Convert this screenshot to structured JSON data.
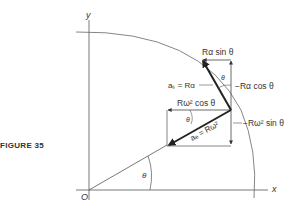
{
  "figure": {
    "caption": "FIGURE 35",
    "axes": {
      "x_label": "x",
      "y_label": "y",
      "origin_label": "O"
    },
    "angle_label": "θ",
    "tangential": {
      "vector_label": "aₛ = Rα",
      "horizontal_component": "Rα sin θ",
      "vertical_component": "−Rα cos θ",
      "angle_label": "θ"
    },
    "centripetal": {
      "vector_label": "aₑ = Rω²",
      "horizontal_component": "Rω² cos θ",
      "vertical_component": "−Rω² sin θ",
      "angle_label": "θ"
    },
    "colors": {
      "ink": "#333333",
      "background": "#ffffff"
    }
  }
}
